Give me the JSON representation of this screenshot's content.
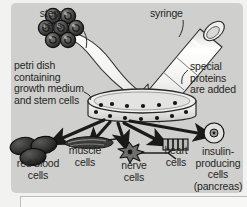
{
  "figure": {
    "panel_color": "#cfcfcd",
    "page_color": "#f2f2f0",
    "ink_color": "#262626",
    "labels": {
      "stem_cells": "stem\ncells",
      "syringe": "syringe",
      "petri_dish": "petri dish\ncontaining\ngrowth medium\nand stem cells",
      "special_proteins": "special\nproteins\nare added",
      "red_blood_cells": "red blood\ncells",
      "muscle_cells": "muscle\ncells",
      "nerve_cells": "nerve\ncells",
      "heart_cells": "heart\ncells",
      "insulin_cells": "insulin-\nproducing\ncells\n(pancreas)"
    },
    "elements": {
      "stem_cell_cluster_count": 7,
      "petri_dish_cell_dots": 13,
      "red_blood_cell_count": 3,
      "differentiation_arrow_count": 5
    }
  }
}
